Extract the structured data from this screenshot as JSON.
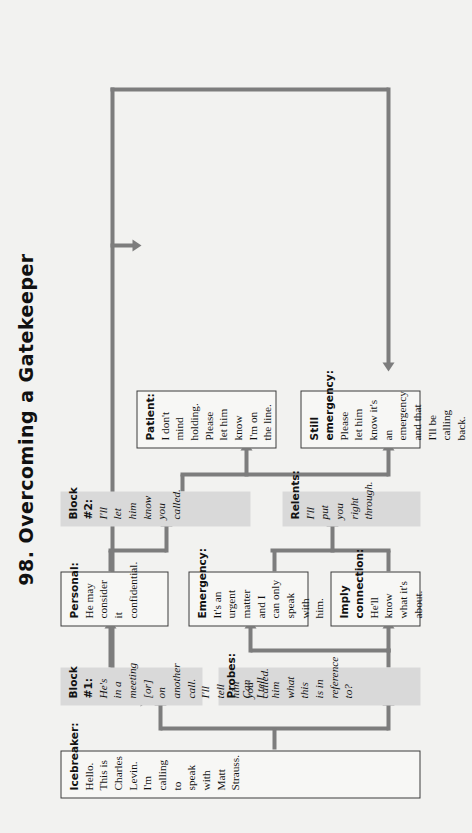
{
  "title": "98. Overcoming a Gatekeeper",
  "colors": {
    "page_background": "#f2f2f0",
    "gray_box_fill": "#d9d9d9",
    "white_box_fill": "#f7f7f5",
    "box_border": "#3a3a3a",
    "connector": "#7d7d7d",
    "text": "#111111"
  },
  "nodes": [
    {
      "id": "icebreaker",
      "style": "white",
      "label": "Icebreaker:",
      "text": "Hello. This is Charles Levin. I'm calling to speak with Matt Strauss.",
      "italic": false
    },
    {
      "id": "probes",
      "style": "gray",
      "label": "Probes:",
      "text": "Can I tell him what this is in reference to?",
      "italic": true
    },
    {
      "id": "block1",
      "style": "gray",
      "label": "Block #1:",
      "text": "He's in a meeting [or] on another call. I'll tell him you called.",
      "italic": true
    },
    {
      "id": "imply-connection",
      "style": "white",
      "label": "Imply connection:",
      "text": "He'll know what it's about.",
      "italic": false
    },
    {
      "id": "emergency",
      "style": "white",
      "label": "Emergency:",
      "text": "It's an urgent matter and I can only speak with him.",
      "italic": false
    },
    {
      "id": "personal",
      "style": "white",
      "label": "Personal:",
      "text": "He may consider it confidential.",
      "italic": false
    },
    {
      "id": "relents",
      "style": "gray",
      "label": "Relents:",
      "text": "I'll put you right through.",
      "italic": true
    },
    {
      "id": "block2",
      "style": "gray",
      "label": "Block #2:",
      "text": "I'll let him know you called.",
      "italic": true
    },
    {
      "id": "still-emergency",
      "style": "white",
      "label": "Still emergency:",
      "text": "Please let him know it's an emergency and that I'll be calling back.",
      "italic": false
    },
    {
      "id": "patient",
      "style": "white",
      "label": "Patient:",
      "text": "I don't mind holding. Please let him know I'm on the line.",
      "italic": false
    }
  ]
}
